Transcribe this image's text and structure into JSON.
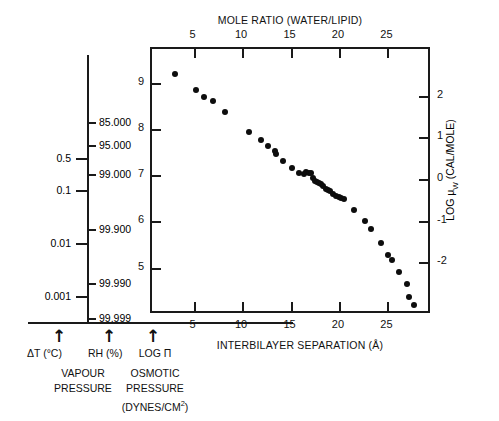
{
  "figure": {
    "top_axis_title": "MOLE RATIO (WATER/LIPID)",
    "bottom_axis_title": "INTERBILAYER SEPARATION (Å)",
    "right_axis_title_main": "LOG μ",
    "right_axis_title_sub": "W",
    "right_axis_title_unit": " (CAL/MOLE)"
  },
  "aux_axis": {
    "left_scale_name": "ΔT (°C)",
    "right_scale_name": "RH (%)",
    "group_title_line1": "VAPOUR",
    "group_title_line2": "PRESSURE",
    "arrow_glyph": "↑",
    "delta_t_ticks": [
      "0.5",
      "0.1",
      "0.01",
      "0.001"
    ],
    "rh_ticks": [
      "85.000",
      "95.000",
      "99.000",
      "99.900",
      "99.990",
      "99.999"
    ]
  },
  "osmotic": {
    "axis_name": "LOG Π",
    "group_title_line1": "OSMOTIC",
    "group_title_line2": "PRESSURE",
    "group_title_line3_pre": "(DYNES/CM",
    "group_title_line3_sup": "2",
    "group_title_line3_post": ")",
    "arrow_glyph": "↑"
  },
  "chart_data": {
    "type": "scatter",
    "title": "",
    "xlabel": "INTERBILAYER SEPARATION (Å)",
    "ylabel": "LOG Π",
    "xlabel_top": "MOLE RATIO (WATER/LIPID)",
    "ylabel_right": "LOG μW (CAL/MOLE)",
    "xlim": [
      0.6,
      29.5
    ],
    "ylim": [
      4.0,
      9.75
    ],
    "xticks": [
      5,
      10,
      15,
      20,
      25
    ],
    "xticklabels": [
      "5",
      "10",
      "15",
      "20",
      "25"
    ],
    "xticks_top": [
      5,
      10,
      15,
      20,
      25
    ],
    "xticklabels_top": [
      "5",
      "10",
      "15",
      "20",
      "25"
    ],
    "yticks": [
      5,
      6,
      7,
      8,
      9
    ],
    "yticklabels": [
      "5",
      "6",
      "7",
      "8",
      "9"
    ],
    "yticks_right": [
      -2,
      -1,
      0,
      1,
      2
    ],
    "yticklabels_right": [
      "-2",
      "-1",
      "0",
      "1",
      "2"
    ],
    "grid": false,
    "legend": "none",
    "marker": "filled-circle",
    "marker_color": "#0d0d0d",
    "series": [
      {
        "name": "egg lecithin",
        "x": [
          3.0,
          5.1,
          6.0,
          6.9,
          8.1,
          10.6,
          11.8,
          12.6,
          13.3,
          13.4,
          14.1,
          15.0,
          15.8,
          16.3,
          16.5,
          16.8,
          17.0,
          17.2,
          17.4,
          17.6,
          17.8,
          18.0,
          18.3,
          18.6,
          18.8,
          19.0,
          19.3,
          19.6,
          19.9,
          20.1,
          20.4,
          21.5,
          22.6,
          23.2,
          24.2,
          25.0,
          25.4,
          26.1,
          26.9,
          27.1,
          27.6
        ],
        "y": [
          9.22,
          8.86,
          8.72,
          8.62,
          8.39,
          7.95,
          7.78,
          7.66,
          7.54,
          7.47,
          7.33,
          7.18,
          7.06,
          7.04,
          7.1,
          7.08,
          7.06,
          6.96,
          6.9,
          6.88,
          6.86,
          6.84,
          6.78,
          6.72,
          6.7,
          6.68,
          6.62,
          6.58,
          6.56,
          6.52,
          6.5,
          6.26,
          6.04,
          5.86,
          5.56,
          5.3,
          5.18,
          4.92,
          4.66,
          4.38,
          4.22
        ]
      }
    ]
  }
}
